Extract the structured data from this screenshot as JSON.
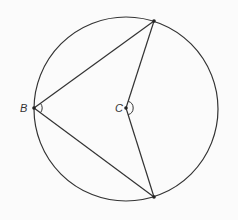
{
  "diagram": {
    "circle": {
      "cx": 126,
      "cy": 109,
      "r": 92,
      "stroke": "#333333"
    },
    "points": {
      "B": {
        "x": 34,
        "y": 108,
        "label": "B"
      },
      "C": {
        "x": 126,
        "y": 108,
        "label": "C"
      },
      "top": {
        "x": 154,
        "y": 21
      },
      "bottom": {
        "x": 154,
        "y": 197
      }
    },
    "labels": {
      "B": "B",
      "C": "C"
    },
    "angle_marks": [
      "B",
      "C"
    ]
  }
}
